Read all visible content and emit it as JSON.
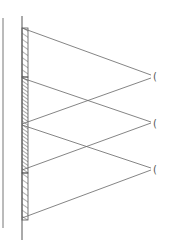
{
  "diagram": {
    "title": "",
    "type": "mirror ray diagram",
    "colors": {
      "line": "#555555",
      "hatch": "#666666",
      "background": "#ffffff"
    },
    "eyes": [
      {
        "label": "eye-1",
        "glyph": "("
      },
      {
        "label": "eye-2",
        "glyph": "("
      },
      {
        "label": "eye-3",
        "glyph": "("
      }
    ]
  }
}
